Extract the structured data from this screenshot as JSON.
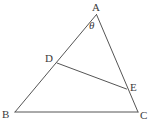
{
  "figure": {
    "type": "geometry-diagram",
    "shape": "triangle-with-cevian",
    "background_color": "#ffffff",
    "stroke_color": "#555555",
    "label_color": "#3b3b3b",
    "stroke_width": 1,
    "width": 153,
    "height": 127,
    "points": [
      {
        "id": "A",
        "label": "A",
        "x": 96.5,
        "y": 14.5,
        "label_x": 92,
        "label_y": 2
      },
      {
        "id": "B",
        "label": "B",
        "x": 15,
        "y": 112,
        "label_x": 2,
        "label_y": 109
      },
      {
        "id": "C",
        "label": "C",
        "x": 138,
        "y": 112,
        "label_x": 140,
        "label_y": 110
      },
      {
        "id": "D",
        "label": "D",
        "x": 57,
        "y": 63,
        "label_x": 45,
        "label_y": 53
      },
      {
        "id": "E",
        "label": "E",
        "x": 126.5,
        "y": 89,
        "label_x": 130,
        "label_y": 82
      }
    ],
    "segments": [
      {
        "name": "side-AB",
        "from": "A",
        "to": "B"
      },
      {
        "name": "side-AC",
        "from": "A",
        "to": "C"
      },
      {
        "name": "side-BC",
        "from": "B",
        "to": "C"
      },
      {
        "name": "segment-DE",
        "from": "D",
        "to": "E"
      }
    ],
    "angles": [
      {
        "name": "angle-at-A",
        "label": "θ",
        "vertex": "A",
        "label_x": 89,
        "label_y": 20
      }
    ]
  }
}
